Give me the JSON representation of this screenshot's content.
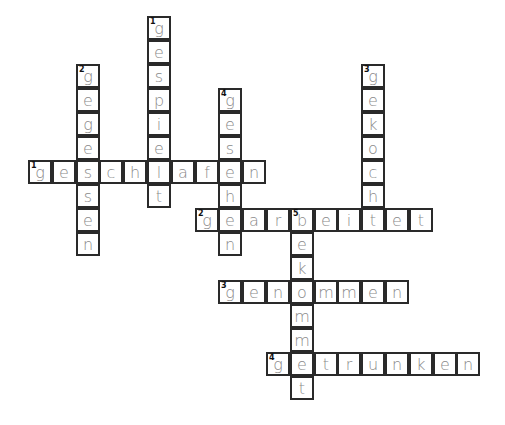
{
  "puzzle": {
    "cell_size": 24,
    "origin_x": 28,
    "origin_y": 160,
    "col_step": 23.8,
    "row_step": 24,
    "words": [
      {
        "id": "across-1",
        "direction": "across",
        "number": "1",
        "row": 0,
        "col": 0,
        "answer": "geschlafen"
      },
      {
        "id": "across-2",
        "direction": "across",
        "number": "2",
        "row": 2,
        "col": 7,
        "answer": "gearbeitet"
      },
      {
        "id": "across-3",
        "direction": "across",
        "number": "3",
        "row": 5,
        "col": 8,
        "answer": "genommen"
      },
      {
        "id": "across-4",
        "direction": "across",
        "number": "4",
        "row": 8,
        "col": 10,
        "answer": "getrunken"
      },
      {
        "id": "down-1",
        "direction": "down",
        "number": "1",
        "row": -6,
        "col": 5,
        "answer": "gespielt"
      },
      {
        "id": "down-2",
        "direction": "down",
        "number": "2",
        "row": -4,
        "col": 2,
        "answer": "gegessen"
      },
      {
        "id": "down-3",
        "direction": "down",
        "number": "3",
        "row": -4,
        "col": 14,
        "answer": "gekocht"
      },
      {
        "id": "down-4",
        "direction": "down",
        "number": "4",
        "row": -3,
        "col": 8,
        "answer": "gesehen"
      },
      {
        "id": "down-5",
        "direction": "down",
        "number": "5",
        "row": 2,
        "col": 11,
        "answer": "bekommet"
      }
    ]
  }
}
